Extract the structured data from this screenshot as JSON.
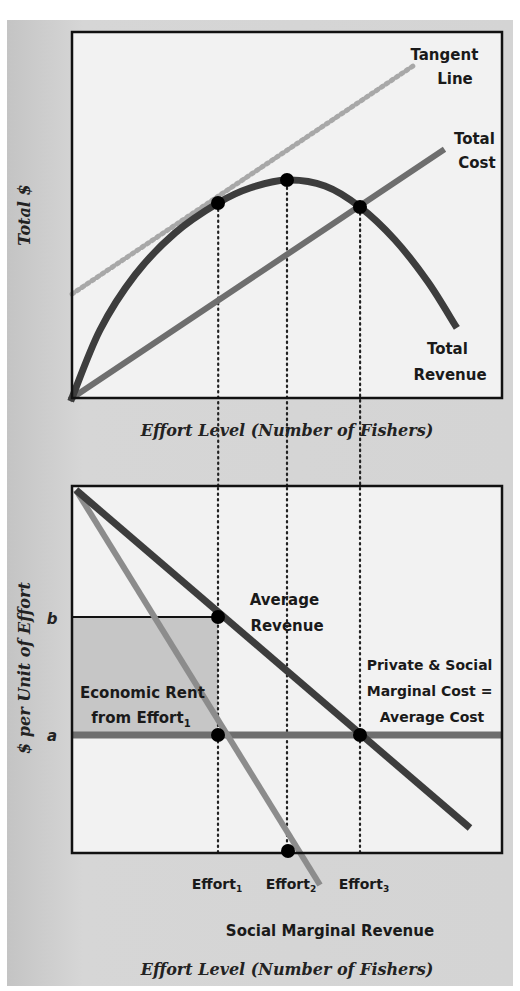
{
  "colors": {
    "panel_bg": "#d2d2d2",
    "plot_bg": "#f2f2f2",
    "rent_fill": "#c6c6c6",
    "total_revenue": "#3d3d3d",
    "total_cost": "#6e6e6e",
    "tangent": "#a8a8a8",
    "average_revenue": "#3d3d3d",
    "social_marginal_revenue": "#8c8c8c",
    "cost_line": "#6e6e6e",
    "points": "#000000",
    "guide": "#222222"
  },
  "chart_data": [
    {
      "type": "line",
      "title": "",
      "xlabel": "Effort Level (Number of Fishers)",
      "ylabel": "Total $",
      "xlim": [
        0,
        1
      ],
      "ylim": [
        0,
        1
      ],
      "grid": false,
      "axis_ticks": false,
      "series": [
        {
          "name": "Total Revenue",
          "label_lines": [
            "Total",
            "Revenue"
          ],
          "style": "solid",
          "points": [
            [
              0,
              0
            ],
            [
              0.1,
              0.32
            ],
            [
              0.2,
              0.54
            ],
            [
              0.3,
              0.66
            ],
            [
              0.34,
              0.68
            ],
            [
              0.4,
              0.72
            ],
            [
              0.5,
              0.74
            ],
            [
              0.6,
              0.72
            ],
            [
              0.67,
              0.65
            ],
            [
              0.75,
              0.52
            ],
            [
              0.85,
              0.32
            ],
            [
              0.89,
              0.2
            ]
          ]
        },
        {
          "name": "Total Cost",
          "label_lines": [
            "Total",
            "Cost"
          ],
          "style": "solid",
          "points": [
            [
              0,
              0
            ],
            [
              0.86,
              0.67
            ]
          ]
        },
        {
          "name": "Tangent Line",
          "label_lines": [
            "Tangent",
            "Line"
          ],
          "style": "dotted",
          "points": [
            [
              0,
              0.28
            ],
            [
              0.79,
              0.9
            ]
          ]
        }
      ],
      "marked_points": [
        {
          "name": "Effort1 tangency",
          "x": 0.34,
          "y": 0.53
        },
        {
          "name": "Effort2 maximum",
          "x": 0.5,
          "y": 0.59
        },
        {
          "name": "Effort3 intersection",
          "x": 0.67,
          "y": 0.52
        }
      ],
      "guides": [
        {
          "x": 0.34,
          "label": "Effort1"
        },
        {
          "x": 0.5,
          "label": "Effort2"
        },
        {
          "x": 0.67,
          "label": "Effort3"
        }
      ]
    },
    {
      "type": "line",
      "title": "",
      "xlabel": "Effort Level (Number of Fishers)",
      "ylabel": "$ per Unit of Effort",
      "xlim": [
        0,
        1
      ],
      "ylim": [
        0,
        1
      ],
      "grid": false,
      "y_tick_labels": [
        {
          "label": "b",
          "value": 0.64
        },
        {
          "label": "a",
          "value": 0.32
        }
      ],
      "x_tick_labels": [
        {
          "base": "Effort",
          "sub": "1",
          "value": 0.34
        },
        {
          "base": "Effort",
          "sub": "2",
          "value": 0.5
        },
        {
          "base": "Effort",
          "sub": "3",
          "value": 0.67
        }
      ],
      "series": [
        {
          "name": "Average Revenue",
          "label_lines": [
            "Average",
            "Revenue"
          ],
          "style": "solid",
          "points": [
            [
              0,
              1
            ],
            [
              0.93,
              0.07
            ]
          ]
        },
        {
          "name": "Social Marginal Revenue",
          "label_lines": [
            "Social Marginal Revenue"
          ],
          "style": "solid",
          "points": [
            [
              0,
              1
            ],
            [
              0.58,
              -0.09
            ]
          ]
        },
        {
          "name": "Private & Social Marginal Cost = Average Cost",
          "label_lines": [
            "Private & Social",
            "Marginal Cost =",
            "Average Cost"
          ],
          "style": "solid",
          "points": [
            [
              0,
              0.32
            ],
            [
              1,
              0.32
            ]
          ]
        }
      ],
      "shaded_area": {
        "name": "Economic Rent from Effort1",
        "label_lines": [
          "Economic Rent",
          "from Effort"
        ],
        "label_sub": "1",
        "x": [
          0,
          0.34
        ],
        "y": [
          0.32,
          0.64
        ]
      },
      "marked_points": [
        {
          "name": "AR at Effort1",
          "x": 0.34,
          "y": 0.64
        },
        {
          "name": "Cost at Effort1",
          "x": 0.34,
          "y": 0.32
        },
        {
          "name": "SMR zero at Effort2",
          "x": 0.5,
          "y": 0
        },
        {
          "name": "AR equals cost at Effort3",
          "x": 0.67,
          "y": 0.32
        }
      ]
    }
  ]
}
